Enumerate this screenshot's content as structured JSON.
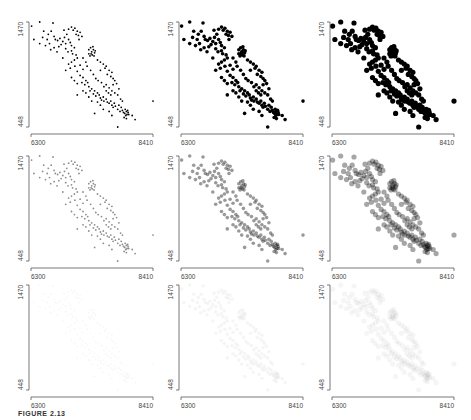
{
  "figure": {
    "caption": "FIGURE 2.13",
    "grid": {
      "rows": 3,
      "cols": 3
    }
  },
  "chart_data": {
    "type": "scatter",
    "title": "",
    "xlabel": "",
    "ylabel": "",
    "x_ticks": [
      "6300",
      "8410"
    ],
    "y_ticks": [
      "448",
      "1470"
    ],
    "xlim": [
      6300,
      8410
    ],
    "ylim": [
      448,
      1470
    ],
    "grid": false,
    "legend": null,
    "panels": [
      {
        "row": 0,
        "col": 0,
        "point_radius": 0.9,
        "opacity": 1.0
      },
      {
        "row": 0,
        "col": 1,
        "point_radius": 1.8,
        "opacity": 1.0
      },
      {
        "row": 0,
        "col": 2,
        "point_radius": 2.6,
        "opacity": 1.0
      },
      {
        "row": 1,
        "col": 0,
        "point_radius": 0.9,
        "opacity": 0.45
      },
      {
        "row": 1,
        "col": 1,
        "point_radius": 1.8,
        "opacity": 0.4
      },
      {
        "row": 1,
        "col": 2,
        "point_radius": 2.6,
        "opacity": 0.35
      },
      {
        "row": 2,
        "col": 0,
        "point_radius": 0.9,
        "opacity": 0.04
      },
      {
        "row": 2,
        "col": 1,
        "point_radius": 1.8,
        "opacity": 0.04
      },
      {
        "row": 2,
        "col": 2,
        "point_radius": 2.6,
        "opacity": 0.04
      }
    ],
    "clusters_description": "Negatively correlated point cloud running from upper-left (~6500,1400) to lower-right (~8000,560), with dense clumps near (7050,1300), (7350,1150), (7950,600) and outliers at (8410,700), (7800,448).",
    "points": [
      [
        6310,
        1430
      ],
      [
        6450,
        1470
      ],
      [
        6680,
        1460
      ],
      [
        6520,
        1380
      ],
      [
        6350,
        1300
      ],
      [
        6450,
        1260
      ],
      [
        6600,
        1350
      ],
      [
        6650,
        1380
      ],
      [
        6700,
        1330
      ],
      [
        6720,
        1300
      ],
      [
        6760,
        1290
      ],
      [
        6800,
        1310
      ],
      [
        6850,
        1280
      ],
      [
        6880,
        1320
      ],
      [
        6900,
        1260
      ],
      [
        6950,
        1300
      ],
      [
        6980,
        1270
      ],
      [
        7000,
        1240
      ],
      [
        6820,
        1250
      ],
      [
        6780,
        1230
      ],
      [
        6900,
        1210
      ],
      [
        6940,
        1180
      ],
      [
        7000,
        1190
      ],
      [
        7050,
        1220
      ],
      [
        7020,
        1160
      ],
      [
        7080,
        1150
      ],
      [
        7050,
        1100
      ],
      [
        7100,
        1120
      ],
      [
        7000,
        1080
      ],
      [
        6950,
        1060
      ],
      [
        6980,
        1020
      ],
      [
        6900,
        1000
      ],
      [
        7060,
        1040
      ],
      [
        7100,
        990
      ],
      [
        7150,
        1050
      ],
      [
        7200,
        1010
      ],
      [
        6950,
        1400
      ],
      [
        7000,
        1420
      ],
      [
        7030,
        1390
      ],
      [
        7060,
        1410
      ],
      [
        7100,
        1380
      ],
      [
        7080,
        1350
      ],
      [
        7120,
        1340
      ],
      [
        7150,
        1370
      ],
      [
        7180,
        1330
      ],
      [
        7130,
        1300
      ],
      [
        6920,
        1350
      ],
      [
        6870,
        1390
      ],
      [
        7300,
        1200
      ],
      [
        7330,
        1220
      ],
      [
        7350,
        1180
      ],
      [
        7380,
        1200
      ],
      [
        7360,
        1150
      ],
      [
        7400,
        1170
      ],
      [
        7340,
        1160
      ],
      [
        7390,
        1140
      ],
      [
        7320,
        1140
      ],
      [
        7370,
        1230
      ],
      [
        7410,
        1190
      ],
      [
        7300,
        1160
      ],
      [
        7450,
        1100
      ],
      [
        7500,
        1080
      ],
      [
        7550,
        1060
      ],
      [
        7600,
        1040
      ],
      [
        7650,
        1000
      ],
      [
        7700,
        980
      ],
      [
        7580,
        1020
      ],
      [
        7620,
        960
      ],
      [
        7680,
        940
      ],
      [
        7720,
        920
      ],
      [
        7750,
        900
      ],
      [
        7500,
        1000
      ],
      [
        7150,
        950
      ],
      [
        7200,
        930
      ],
      [
        7250,
        900
      ],
      [
        7180,
        880
      ],
      [
        7230,
        860
      ],
      [
        7280,
        880
      ],
      [
        7300,
        840
      ],
      [
        7350,
        820
      ],
      [
        7320,
        800
      ],
      [
        7400,
        800
      ],
      [
        7380,
        770
      ],
      [
        7450,
        780
      ],
      [
        7420,
        750
      ],
      [
        7480,
        760
      ],
      [
        7500,
        730
      ],
      [
        7520,
        710
      ],
      [
        7550,
        740
      ],
      [
        7560,
        700
      ],
      [
        7600,
        720
      ],
      [
        7620,
        690
      ],
      [
        7650,
        680
      ],
      [
        7680,
        700
      ],
      [
        7700,
        660
      ],
      [
        7720,
        640
      ],
      [
        7740,
        680
      ],
      [
        7760,
        650
      ],
      [
        7800,
        620
      ],
      [
        7820,
        660
      ],
      [
        7840,
        600
      ],
      [
        7860,
        640
      ],
      [
        7880,
        610
      ],
      [
        7900,
        590
      ],
      [
        7920,
        580
      ],
      [
        7950,
        600
      ],
      [
        7960,
        570
      ],
      [
        7940,
        560
      ],
      [
        7980,
        590
      ],
      [
        7930,
        620
      ],
      [
        7970,
        610
      ],
      [
        7990,
        570
      ],
      [
        7910,
        540
      ],
      [
        7950,
        530
      ],
      [
        8050,
        560
      ],
      [
        8100,
        520
      ],
      [
        7700,
        560
      ],
      [
        7650,
        600
      ],
      [
        7550,
        620
      ],
      [
        7500,
        660
      ],
      [
        7450,
        690
      ],
      [
        7350,
        700
      ],
      [
        7300,
        740
      ],
      [
        7250,
        780
      ],
      [
        7200,
        800
      ],
      [
        7100,
        870
      ],
      [
        7050,
        900
      ],
      [
        7000,
        930
      ],
      [
        7600,
        860
      ],
      [
        7650,
        830
      ],
      [
        7700,
        800
      ],
      [
        7750,
        780
      ],
      [
        7800,
        760
      ],
      [
        7850,
        720
      ],
      [
        7880,
        700
      ],
      [
        7820,
        820
      ],
      [
        7780,
        870
      ],
      [
        7720,
        860
      ],
      [
        8410,
        700
      ],
      [
        7800,
        448
      ],
      [
        7400,
        580
      ],
      [
        7100,
        760
      ],
      [
        6850,
        1120
      ],
      [
        6750,
        1180
      ],
      [
        6700,
        1220
      ],
      [
        6620,
        1260
      ],
      [
        6580,
        1300
      ],
      [
        6550,
        1240
      ],
      [
        6500,
        1320
      ],
      [
        6640,
        1200
      ],
      [
        7250,
        1080
      ],
      [
        7200,
        1120
      ],
      [
        7270,
        1040
      ],
      [
        7330,
        1000
      ],
      [
        7380,
        960
      ],
      [
        7420,
        920
      ],
      [
        7460,
        900
      ],
      [
        7520,
        880
      ],
      [
        7560,
        840
      ],
      [
        7600,
        800
      ],
      [
        7640,
        780
      ],
      [
        7680,
        760
      ]
    ]
  }
}
